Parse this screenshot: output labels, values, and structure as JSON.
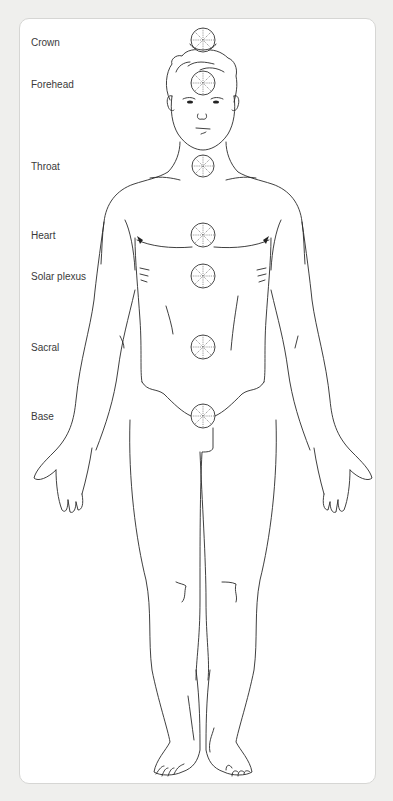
{
  "diagram": {
    "colors": {
      "background": "#efefed",
      "card": "#ffffff",
      "card_border": "#d6d6d4",
      "line": "#2a2a2a",
      "label_text": "#3a3a3a"
    },
    "labels": [
      {
        "id": "crown",
        "text": "Crown",
        "y": 37
      },
      {
        "id": "forehead",
        "text": "Forehead",
        "y": 79
      },
      {
        "id": "throat",
        "text": "Throat",
        "y": 161
      },
      {
        "id": "heart",
        "text": "Heart",
        "y": 230
      },
      {
        "id": "solar-plexus",
        "text": "Solar plexus",
        "y": 271
      },
      {
        "id": "sacral",
        "text": "Sacral",
        "y": 342
      },
      {
        "id": "base",
        "text": "Base",
        "y": 411
      }
    ],
    "chakras": [
      {
        "id": "crown",
        "cx": 203,
        "cy": 40,
        "r": 12
      },
      {
        "id": "forehead",
        "cx": 203,
        "cy": 83,
        "r": 12
      },
      {
        "id": "throat",
        "cx": 203,
        "cy": 166,
        "r": 11
      },
      {
        "id": "heart",
        "cx": 203,
        "cy": 235,
        "r": 12
      },
      {
        "id": "solar-plexus",
        "cx": 203,
        "cy": 276,
        "r": 12
      },
      {
        "id": "sacral",
        "cx": 203,
        "cy": 347,
        "r": 12
      },
      {
        "id": "base",
        "cx": 203,
        "cy": 416,
        "r": 12
      }
    ]
  }
}
